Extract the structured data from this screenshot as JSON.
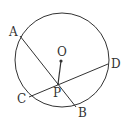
{
  "diagram": {
    "type": "circle-geometry",
    "circle": {
      "center": [
        62,
        60
      ],
      "radius": 47
    },
    "points": {
      "A": {
        "label": "A",
        "x": 20,
        "y": 36
      },
      "B": {
        "label": "B",
        "x": 76,
        "y": 107
      },
      "C": {
        "label": "C",
        "x": 29,
        "y": 97
      },
      "D": {
        "label": "D",
        "x": 108,
        "y": 64
      },
      "O": {
        "label": "O",
        "x": 61,
        "y": 61
      },
      "P": {
        "label": "P",
        "x": 58,
        "y": 84
      }
    },
    "segments": [
      {
        "name": "chord-AB",
        "from": "A",
        "to": "B"
      },
      {
        "name": "chord-CD",
        "from": "C",
        "to": "D"
      },
      {
        "name": "segment-OP",
        "from": "O",
        "to": "P"
      }
    ],
    "stroke_color": "#333333"
  }
}
